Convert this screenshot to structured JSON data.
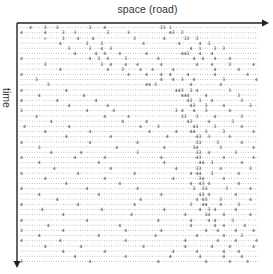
{
  "diagram": {
    "type": "space-time traffic diagram",
    "x_axis_label": "space (road)",
    "y_axis_label": "time",
    "colors": {
      "axis": "#222222",
      "dots": "#9a9a9a",
      "cars": "#333333"
    },
    "rows": 46,
    "cells_per_row": 80,
    "row_strings": [
      "...4....3...3..........3....4..................33.1..........................",
      "4.......4.....3...3..........3......3.............43..2.......................",
      "........>.....3....4....4.............3.........4......33..3..................",
      ".............4........3....3.............4...........4......4..3................",
      "................3......3...4..3..........................4..1....3..3...........",
      "..................4......4..4....4........4...........443...4...4.................",
      "4......................4..3..4.....3..........4...........4..4...4....4...........",
      "........3..................3..4....4...4.......4...........4....4.....3.......4...",
      ".............4...............4....3.....4...4......4.............4.......4.........",
      "4...................................4.....4....4..4.....4........4..........4......",
      ".....3.........................................4...4..3...4.........3..........4..",
      ".........3................................44.3...........4.........4............",
      "4..............4....................................443..3.4..........3..........",
      "......4..............4................................444.....4..........3.........",
      "4...........4............4..............................43..3...4.........3.......",
      "................4............4...........................43...3.....4........3...",
      "3.....................4........4....................3.4...4...3.......4..........",
      ".....4......................4.......4.................33...3.....4........3......",
      "..........4.......................4.......4.............43.....4.......3........4",
      ".4..............4.......................4.....3...........43.....3........4......",
      "........4..............4...................4........4....44...3.....3.........4..",
      "...............4..............4..................4.........43..3......4.........4",
      "4......................4...............4...................33.....3.......4......",
      "......3.........................4...............4.........34.......3..........4.",
      "..........4.........4..................3...................33..4........3.......",
      "4.................4.........4..................4...........43.......4.........4.",
      "......4...................4.....................4...........44..3.........4......",
      "...........4..................4.....................4......33......4.........3..",
      "4..................4..................4..................4.44...3........4......",
      "........4...................4......................4........34......4...........",
      "...............4.................4.......................4..43.4.........4......",
      "4.....................4................4..................3..33......3.......4..",
      "......4...................4....................4............43.4........4.......",
      "............4...........................4..................4.43....3.........4..",
      "4..................4..................4..................3...44....4.....3.......",
      ".......4...................4....................4...........4..3.4......4.......4",
      "..............4......................4.................4......34....4........4...",
      "4.....................4.......................4..........4.....4.4.....3........",
      ".........4.......................4.......................4.......4..4......4....",
      "3.............4....................4...........4..............4...4.....4.....4",
      "......4...................4..................4.............4........4.....3.....",
      "4............4.....................4...................4..........4.....4......4",
      "........4...........4....................4.............4........4.....4.......4",
      "..............4.............4......................4.......4........4....4.....",
      "..................4................4..............4.........4.......4.....4.....",
      "3......................4......................4...............4.......4.....4..."
    ]
  }
}
